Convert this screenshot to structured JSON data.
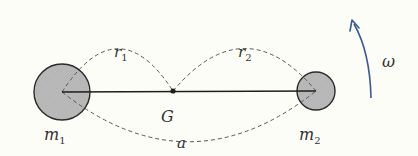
{
  "diagram": {
    "labels": {
      "m1": "m",
      "m1_sub": "1",
      "m2": "m",
      "m2_sub": "2",
      "r1": "r",
      "r1_sub": "1",
      "r2": "r",
      "r2_sub": "2",
      "G": "G",
      "a": "a",
      "omega": "ω"
    },
    "colors": {
      "mass_fill": "#b8b8b8",
      "stroke": "#2a2a2a",
      "dashed": "#555555",
      "arrow": "#3a5a9a",
      "background": "#fdfdf8"
    },
    "icons": {
      "rotation_arrow": "curved-arrow-up"
    }
  }
}
